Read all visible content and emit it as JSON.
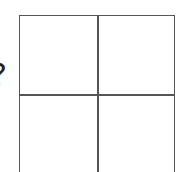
{
  "diagram": {
    "type": "2x2 grid",
    "rows": 2,
    "cols": 2,
    "line_color": "#555555",
    "background": "#ffffff",
    "edge_label": "?",
    "cells": [
      {
        "row": 0,
        "col": 0,
        "label": ""
      },
      {
        "row": 0,
        "col": 1,
        "label": ""
      },
      {
        "row": 1,
        "col": 0,
        "label": ""
      },
      {
        "row": 1,
        "col": 1,
        "label": ""
      }
    ]
  }
}
